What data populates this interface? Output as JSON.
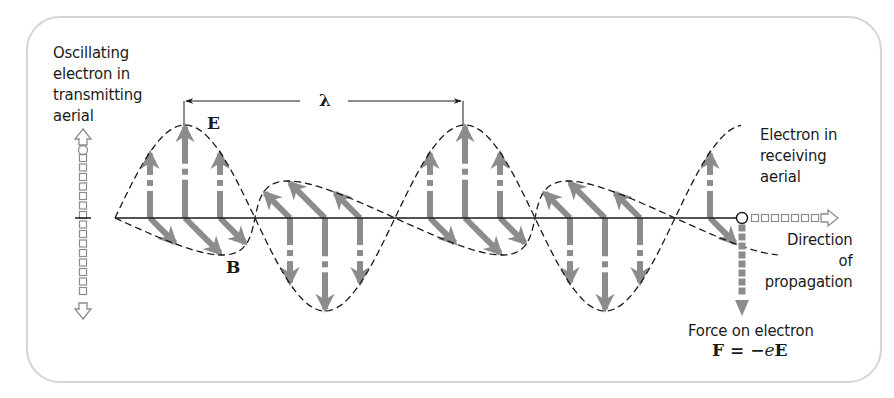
{
  "labels": {
    "transmitter": "Oscillating\nelectron in\ntransmitting\naerial",
    "receiver": "Electron in\nreceiving\naerial",
    "direction": "Direction\nof\npropagation",
    "force": "Force on electron",
    "formula_lhs": "F = −",
    "formula_e": "e",
    "formula_rhs": "E",
    "E": "E",
    "B": "B",
    "lambda": "λ"
  },
  "wave": {
    "axis_y": 218,
    "x_start": 115,
    "x_end": 742,
    "half_wavelength": 140,
    "e_amplitude": 93,
    "b_amplitude": 37,
    "arrow_positions": [
      0.25,
      0.5,
      0.75
    ],
    "lobes": 5
  },
  "colors": {
    "field_arrow": "#8c8c8c",
    "outline": "#1a1a1a",
    "frame": "#d4d4d4"
  }
}
